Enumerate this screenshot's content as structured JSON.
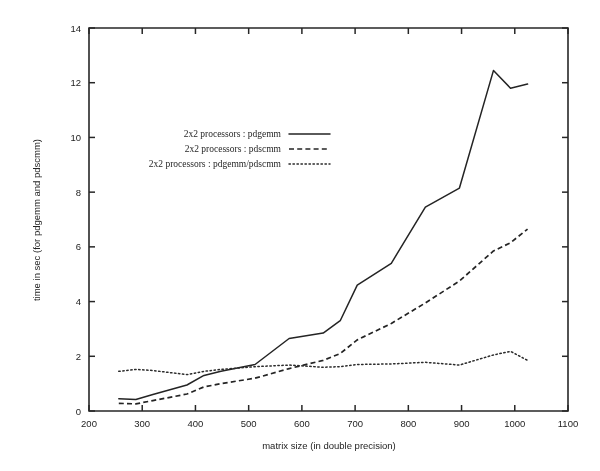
{
  "figure": {
    "title": "",
    "background": "#ffffff",
    "ink_color": "#242424"
  },
  "axes": {
    "x": {
      "label": "matrix size (in double precision)",
      "min": 200,
      "max": 1100,
      "tick_step": 100,
      "ticks": [
        "200",
        "300",
        "400",
        "500",
        "600",
        "700",
        "800",
        "900",
        "1000",
        "1100"
      ]
    },
    "y": {
      "label": "time in sec (for pdgemm and pdscmm)",
      "min": 0,
      "max": 14,
      "tick_step": 2,
      "ticks": [
        "0",
        "2",
        "4",
        "6",
        "8",
        "10",
        "12",
        "14"
      ]
    }
  },
  "legend": {
    "position": "upper-left-inside",
    "entries": [
      {
        "label": "2x2 processors : pdgemm",
        "style": "solid"
      },
      {
        "label": "2x2 processors : pdscmm",
        "style": "dashed"
      },
      {
        "label": "2x2 processors : pdgemm/pdscmm",
        "style": "dotted"
      }
    ]
  },
  "chart_data": {
    "type": "line",
    "title": "",
    "xlabel": "matrix size (in double precision)",
    "ylabel": "time in sec (for pdgemm and pdscmm)",
    "xlim": [
      200,
      1100
    ],
    "ylim": [
      0,
      14
    ],
    "grid": false,
    "legend_position": "upper-left-inside",
    "x": [
      256,
      288,
      320,
      384,
      416,
      448,
      512,
      576,
      640,
      672,
      704,
      768,
      832,
      896,
      960,
      992,
      1024
    ],
    "series": [
      {
        "name": "2x2 processors : pdgemm",
        "style": "solid",
        "values": [
          0.45,
          0.42,
          0.6,
          0.95,
          1.3,
          1.45,
          1.7,
          2.65,
          2.85,
          3.3,
          4.6,
          5.4,
          7.45,
          8.15,
          12.45,
          11.8,
          11.95
        ]
      },
      {
        "name": "2x2 processors : pdscmm",
        "style": "dashed",
        "values": [
          0.28,
          0.26,
          0.38,
          0.62,
          0.88,
          1.0,
          1.2,
          1.55,
          1.85,
          2.1,
          2.6,
          3.2,
          3.95,
          4.75,
          5.85,
          6.15,
          6.65
        ]
      },
      {
        "name": "2x2 processors : pdgemm/pdscmm",
        "style": "dotted",
        "values": [
          1.45,
          1.52,
          1.48,
          1.33,
          1.45,
          1.52,
          1.62,
          1.68,
          1.6,
          1.62,
          1.7,
          1.72,
          1.78,
          1.68,
          2.05,
          2.18,
          1.85
        ]
      }
    ]
  }
}
